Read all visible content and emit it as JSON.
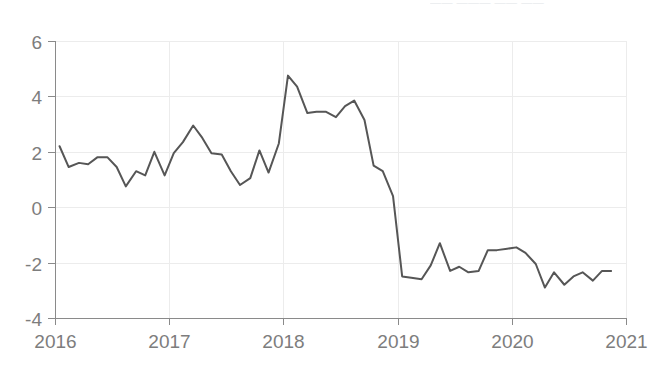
{
  "chart_data": {
    "type": "line",
    "title": "",
    "subtitle": "",
    "xlabel": "",
    "ylabel": "",
    "xlim": [
      2016.0,
      2021.0
    ],
    "ylim": [
      -4,
      6
    ],
    "grid": true,
    "legend": "none",
    "x_tick_labels": [
      "2016",
      "2017",
      "2018",
      "2019",
      "2020",
      "2021"
    ],
    "x_tick_values": [
      2016,
      2017,
      2018,
      2019,
      2020,
      2021
    ],
    "y_tick_labels": [
      "6",
      "4",
      "2",
      "0",
      "-2",
      "-4"
    ],
    "y_tick_values": [
      6,
      4,
      2,
      0,
      -2,
      -4
    ],
    "series": [
      {
        "name": "series-1",
        "color": "#565656",
        "x": [
          2016.04,
          2016.12,
          2016.21,
          2016.29,
          2016.37,
          2016.46,
          2016.54,
          2016.62,
          2016.71,
          2016.79,
          2016.87,
          2016.96,
          2017.04,
          2017.12,
          2017.21,
          2017.29,
          2017.37,
          2017.46,
          2017.54,
          2017.62,
          2017.71,
          2017.79,
          2017.87,
          2017.96,
          2018.04,
          2018.12,
          2018.21,
          2018.29,
          2018.37,
          2018.46,
          2018.54,
          2018.62,
          2018.71,
          2018.79,
          2018.87,
          2018.96,
          2019.04,
          2019.12,
          2019.21,
          2019.29,
          2019.37,
          2019.46,
          2019.54,
          2019.62,
          2019.71,
          2019.79,
          2019.87,
          2019.96,
          2020.04,
          2020.12,
          2020.21,
          2020.29,
          2020.37,
          2020.46,
          2020.54,
          2020.62,
          2020.71,
          2020.79,
          2020.87
        ],
        "y": [
          2.2,
          1.45,
          1.6,
          1.55,
          1.8,
          1.8,
          1.45,
          0.75,
          1.3,
          1.15,
          2.0,
          1.15,
          1.95,
          2.35,
          2.95,
          2.5,
          1.95,
          1.9,
          1.3,
          0.8,
          1.05,
          2.05,
          1.25,
          2.3,
          4.75,
          4.35,
          3.4,
          3.45,
          3.45,
          3.25,
          3.65,
          3.85,
          3.15,
          1.5,
          1.3,
          0.4,
          -2.5,
          -2.55,
          -2.6,
          -2.1,
          -1.3,
          -2.3,
          -2.15,
          -2.35,
          -2.3,
          -1.55,
          -1.55,
          -1.5,
          -1.45,
          -1.65,
          -2.05,
          -2.9,
          -2.35,
          -2.8,
          -2.5,
          -2.35,
          -2.65,
          -2.3,
          -2.3
        ]
      }
    ]
  },
  "axes": {
    "tick_color": "#7d7d7d",
    "axis_color": "#8a8a8a",
    "grid_color": "#ececec"
  },
  "top_clipped_text": "——  ———  ——  ——"
}
